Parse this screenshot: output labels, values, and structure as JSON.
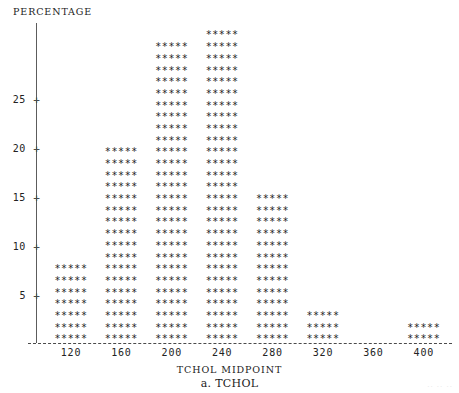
{
  "chart_data": {
    "type": "bar",
    "title": "a. TCHOL",
    "xlabel": "TCHOL MIDPOINT",
    "ylabel": "PERCENTAGE",
    "categories": [
      "120",
      "160",
      "200",
      "240",
      "280",
      "320",
      "360",
      "400"
    ],
    "values": [
      5.5,
      17.5,
      25.5,
      27.0,
      13.5,
      2.0,
      0,
      1.0
    ],
    "star_rows": [
      7,
      17,
      26,
      27,
      13,
      3,
      0,
      2
    ],
    "row_glyph": "*****",
    "ylim": [
      0,
      29
    ],
    "yticks": [
      5,
      10,
      15,
      20,
      25
    ],
    "ytick_labels": [
      "5",
      "10",
      "15",
      "20",
      "25"
    ],
    "xtick_labels": [
      "120",
      "160",
      "200",
      "240",
      "280",
      "320",
      "360",
      "400"
    ],
    "grid": false,
    "legend": null,
    "axis_style": "dashed-baseline-plus-ticks",
    "series_color": "#232323"
  },
  "axes": {
    "y_title": "PERCENTAGE",
    "x_title": "TCHOL MIDPOINT"
  },
  "caption": {
    "text": "a. TCHOL"
  },
  "tick_glyph": "+",
  "artifact": {
    "text": "·· ·· ··"
  }
}
